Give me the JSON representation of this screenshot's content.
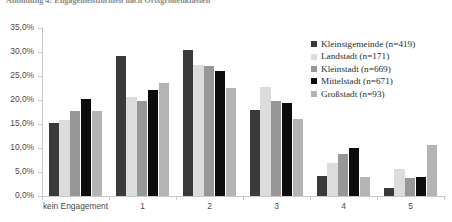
{
  "figure": {
    "title": "Abbildung 4: Engagementformen nach Ortsgrößenklassen"
  },
  "legend": {
    "position": "right",
    "entries": [
      {
        "label": "Kleinstgemeinde (n=419)",
        "color": "#3a3a3a"
      },
      {
        "label": "Landstadt (n=171)",
        "color": "#dcdcdc"
      },
      {
        "label": "Kleinstadt (n=669)",
        "color": "#979797"
      },
      {
        "label": "Mittelstadt (n=671)",
        "color": "#0d0d0d"
      },
      {
        "label": "Großstadt (n=93)",
        "color": "#b4b4b4"
      }
    ]
  },
  "axes": {
    "y_ticks": [
      "0,0%",
      "5,0%",
      "10,0%",
      "15,0%",
      "20,0%",
      "25,0%",
      "30,0%",
      "35,0%"
    ],
    "x_ticks": [
      "kein Engagement",
      "1",
      "2",
      "3",
      "4",
      "5"
    ]
  },
  "chart_data": {
    "type": "bar",
    "title": "Abbildung 4: Engagementformen nach Ortsgrößenklassen",
    "xlabel": "",
    "ylabel": "",
    "ylim": [
      0,
      35
    ],
    "ytick_step": 5,
    "ytick_suffix": "%",
    "grid": false,
    "legend_position": "right",
    "categories": [
      "kein Engagement",
      "1",
      "2",
      "3",
      "4",
      "5"
    ],
    "series": [
      {
        "name": "Kleinstgemeinde (n=419)",
        "color": "#3a3a3a",
        "values": [
          15.3,
          29.1,
          30.5,
          17.9,
          4.2,
          1.7
        ]
      },
      {
        "name": "Landstadt (n=171)",
        "color": "#dcdcdc",
        "values": [
          15.8,
          20.6,
          27.2,
          22.8,
          6.8,
          5.7
        ]
      },
      {
        "name": "Kleinstadt (n=669)",
        "color": "#979797",
        "values": [
          17.8,
          19.8,
          27.0,
          19.8,
          8.8,
          3.7
        ]
      },
      {
        "name": "Mittelstadt (n=671)",
        "color": "#0d0d0d",
        "values": [
          20.2,
          22.0,
          26.1,
          19.3,
          10.0,
          4.0
        ]
      },
      {
        "name": "Großstadt (n=93)",
        "color": "#b4b4b4",
        "values": [
          17.8,
          23.5,
          22.6,
          16.1,
          4.0,
          10.6
        ]
      }
    ]
  }
}
